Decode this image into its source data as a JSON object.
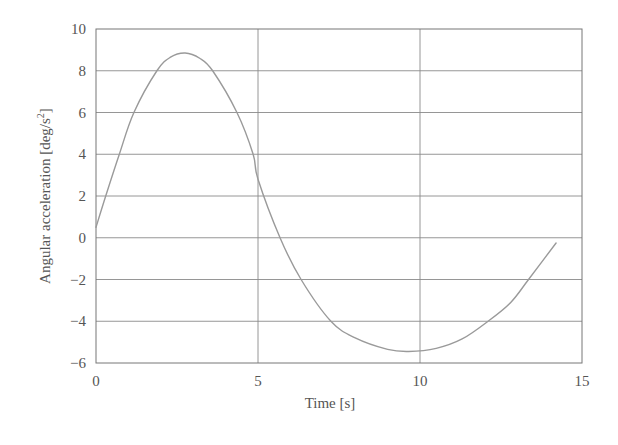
{
  "chart_data": {
    "type": "line",
    "title": "",
    "xlabel": "Time [s]",
    "ylabel": "Angular acceleration [deg/s²]",
    "ylabel_base": "Angular acceleration [deg/s",
    "ylabel_sup": "2",
    "ylabel_close": "]",
    "xlim": [
      0,
      15
    ],
    "ylim": [
      -6,
      10
    ],
    "xticks": [
      0,
      5,
      10,
      15
    ],
    "yticks": [
      -6,
      -4,
      -2,
      0,
      2,
      4,
      6,
      8,
      10
    ],
    "xtick_labels": [
      "0",
      "5",
      "10",
      "15"
    ],
    "ytick_labels": [
      "−6",
      "−4",
      "−2",
      "0",
      "2",
      "4",
      "6",
      "8",
      "10"
    ],
    "grid": true,
    "legend": null,
    "series": [
      {
        "name": "Angular acceleration",
        "color": "#9a9a9a",
        "x": [
          0.0,
          0.3,
          0.72,
          1.17,
          1.88,
          2.3,
          2.75,
          3.2,
          3.6,
          4.35,
          4.85,
          5.0,
          5.68,
          6.33,
          7.25,
          8.0,
          9.0,
          9.65,
          10.5,
          11.3,
          12.1,
          12.8,
          13.35,
          14.2
        ],
        "y": [
          0.5,
          2.0,
          4.0,
          6.0,
          8.0,
          8.65,
          8.85,
          8.6,
          8.0,
          6.0,
          4.0,
          2.8,
          0.0,
          -2.0,
          -4.0,
          -4.8,
          -5.35,
          -5.45,
          -5.3,
          -4.85,
          -4.0,
          -3.1,
          -2.0,
          -0.25
        ]
      }
    ]
  },
  "colors": {
    "axis": "#777777",
    "grid": "#8a8a8a",
    "line": "#9a9a9a",
    "text": "#555555",
    "background": "#ffffff"
  }
}
